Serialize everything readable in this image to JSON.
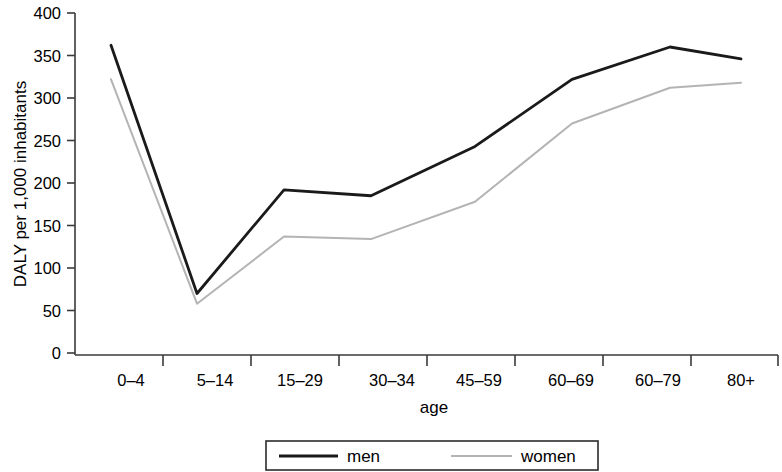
{
  "chart_data": {
    "type": "line",
    "title": "",
    "xlabel": "age",
    "ylabel": "DALY per 1,000 inhabitants",
    "categories": [
      "0–4",
      "5–14",
      "15–29",
      "30–34",
      "45–59",
      "60–69",
      "60–79",
      "80+"
    ],
    "series": [
      {
        "name": "men",
        "color": "#1a1a1a",
        "values": [
          362,
          70,
          192,
          185,
          243,
          322,
          360,
          346
        ]
      },
      {
        "name": "women",
        "color": "#b4b4b4",
        "values": [
          322,
          58,
          137,
          134,
          178,
          270,
          312,
          318
        ]
      }
    ],
    "ylim": [
      0,
      400
    ],
    "yticks": [
      0,
      50,
      100,
      150,
      200,
      250,
      300,
      350,
      400
    ],
    "ytick_labels": [
      "0",
      "50",
      "100",
      "150",
      "200",
      "250",
      "300",
      "350",
      "400"
    ],
    "grid": false,
    "legend_position": "bottom",
    "legend_entries": [
      {
        "label": "men",
        "style": "solid-thick-black"
      },
      {
        "label": "women",
        "style": "solid-thin-gray"
      }
    ]
  }
}
